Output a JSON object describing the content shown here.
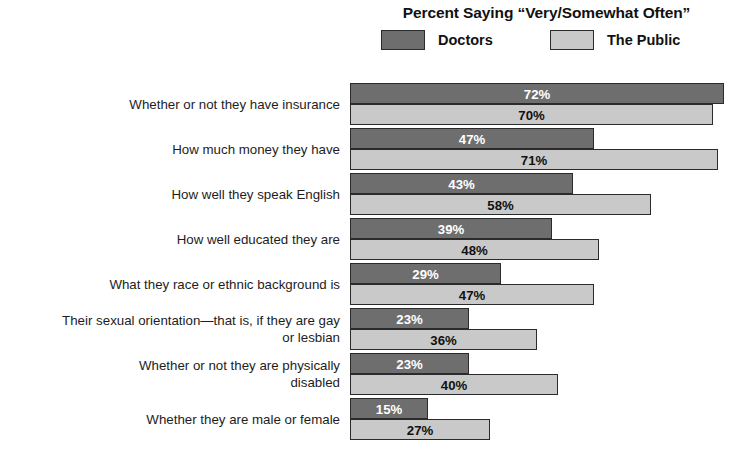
{
  "chart_data": {
    "type": "bar",
    "orientation": "horizontal",
    "title": "Percent Saying “Very/Somewhat Often”",
    "subtitle": "",
    "xlabel": "",
    "ylabel": "",
    "xlim": [
      0,
      80
    ],
    "grid": false,
    "legend_position": "top-center",
    "value_suffix": "%",
    "categories": [
      "Whether or not they have insurance",
      "How much money they have",
      "How well they speak English",
      "How well educated they are",
      "What they race or ethnic background is",
      "Their sexual orientation—that is, if they are gay\nor lesbian",
      "Whether or not they are physically\ndisabled",
      "Whether they are male or female"
    ],
    "series": [
      {
        "name": "Doctors",
        "color": "#6e6e6e",
        "values": [
          72,
          47,
          43,
          39,
          29,
          23,
          23,
          15
        ],
        "labels": [
          "72%",
          "47%",
          "43%",
          "39%",
          "29%",
          "23%",
          "23%",
          "15%"
        ]
      },
      {
        "name": "The Public",
        "color": "#c9c9c9",
        "values": [
          70,
          71,
          58,
          48,
          47,
          36,
          40,
          27
        ],
        "labels": [
          "70%",
          "71%",
          "58%",
          "48%",
          "47%",
          "36%",
          "40%",
          "27%"
        ]
      }
    ]
  },
  "legend": {
    "items": [
      {
        "label": "Doctors",
        "swatch": "dark"
      },
      {
        "label": "The Public",
        "swatch": "light"
      }
    ]
  },
  "colors": {
    "doctors": "#6e6e6e",
    "public": "#c9c9c9",
    "outline": "#2b2b2b",
    "background": "#ffffff",
    "text": "#1a1a1a"
  }
}
